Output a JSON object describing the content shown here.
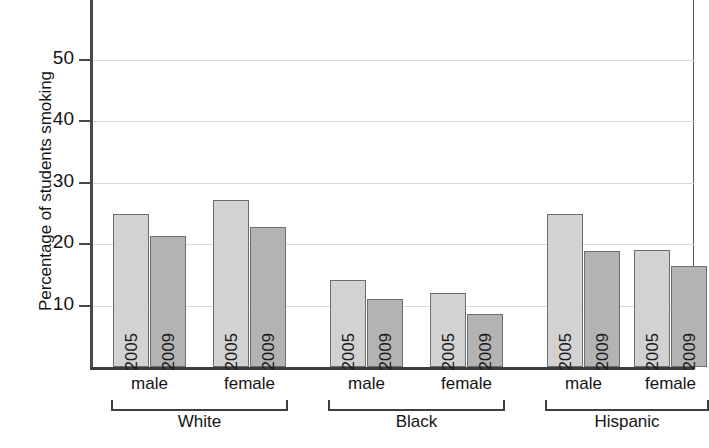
{
  "chart_data": {
    "type": "bar",
    "title": "",
    "xlabel": "",
    "ylabel": "Percentage of students smoking",
    "ylim": [
      0,
      58
    ],
    "yticks": [
      10,
      20,
      30,
      40,
      50
    ],
    "ytick_labels": [
      "10",
      "20",
      "30",
      "40",
      "50"
    ],
    "grid": true,
    "legend_position": "none",
    "categories": [
      "White male",
      "White female",
      "Black male",
      "Black female",
      "Hispanic male",
      "Hispanic female"
    ],
    "series": [
      {
        "name": "2005",
        "values": [
          24.8,
          27.1,
          14.2,
          12.0,
          24.8,
          19.0
        ]
      },
      {
        "name": "2009",
        "values": [
          21.3,
          22.7,
          11.0,
          8.6,
          18.9,
          16.5
        ]
      }
    ],
    "groups": [
      {
        "label": "White",
        "subgroups": [
          {
            "label": "male",
            "bars": [
              {
                "year": "2005",
                "value": 24.8
              },
              {
                "year": "2009",
                "value": 21.3
              }
            ]
          },
          {
            "label": "female",
            "bars": [
              {
                "year": "2005",
                "value": 27.1
              },
              {
                "year": "2009",
                "value": 22.7
              }
            ]
          }
        ]
      },
      {
        "label": "Black",
        "subgroups": [
          {
            "label": "male",
            "bars": [
              {
                "year": "2005",
                "value": 14.2
              },
              {
                "year": "2009",
                "value": 11.0
              }
            ]
          },
          {
            "label": "female",
            "bars": [
              {
                "year": "2005",
                "value": 12.0
              },
              {
                "year": "2009",
                "value": 8.6
              }
            ]
          }
        ]
      },
      {
        "label": "Hispanic",
        "subgroups": [
          {
            "label": "male",
            "bars": [
              {
                "year": "2005",
                "value": 24.8
              },
              {
                "year": "2009",
                "value": 18.9
              }
            ]
          },
          {
            "label": "female",
            "bars": [
              {
                "year": "2005",
                "value": 19.0
              },
              {
                "year": "2009",
                "value": 16.5
              }
            ]
          }
        ]
      }
    ],
    "colors": {
      "bar_2005": "#d2d2d2",
      "bar_2009": "#b3b3b3",
      "bar_outline": "#6d6d6d",
      "axis": "#3f3f3f",
      "gridline": "#d8d8d8",
      "background": "#ffffff",
      "text": "#141414"
    }
  },
  "layout": {
    "plot_left": 90,
    "plot_right": 694,
    "baseline_y": 367,
    "value_10_y": 307,
    "px_per_unit": 6.15,
    "bar_width": 36,
    "bar_positions": [
      113,
      150,
      213,
      250,
      330,
      367,
      430,
      467,
      547,
      584,
      634,
      671
    ]
  }
}
